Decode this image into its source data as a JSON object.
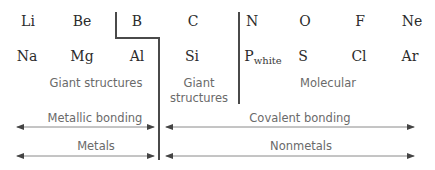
{
  "diagram": {
    "elements_row1": [
      {
        "symbol": "Li",
        "x": 28,
        "y": 21
      },
      {
        "symbol": "Be",
        "x": 82,
        "y": 21
      },
      {
        "symbol": "B",
        "x": 137,
        "y": 21
      },
      {
        "symbol": "C",
        "x": 193,
        "y": 21
      },
      {
        "symbol": "N",
        "x": 252,
        "y": 21
      },
      {
        "symbol": "O",
        "x": 305,
        "y": 21
      },
      {
        "symbol": "F",
        "x": 360,
        "y": 21
      },
      {
        "symbol": "Ne",
        "x": 412,
        "y": 21
      }
    ],
    "elements_row2": [
      {
        "symbol": "Na",
        "x": 27,
        "y": 56
      },
      {
        "symbol": "Mg",
        "x": 82,
        "y": 56
      },
      {
        "symbol": "Al",
        "x": 137,
        "y": 56
      },
      {
        "symbol": "Si",
        "x": 192,
        "y": 56
      },
      {
        "symbol": "P",
        "subscript": "white",
        "x": 263,
        "y": 57
      },
      {
        "symbol": "S",
        "x": 303,
        "y": 56
      },
      {
        "symbol": "Cl",
        "x": 359,
        "y": 56
      },
      {
        "symbol": "Ar",
        "x": 410,
        "y": 56
      }
    ],
    "structure_labels": {
      "giant_metallic": "Giant structures",
      "giant_covalent_line1": "Giant",
      "giant_covalent_line2": "structures",
      "molecular": "Molecular"
    },
    "bonding_labels": {
      "metallic": "Metallic bonding",
      "covalent": "Covalent bonding"
    },
    "classification_labels": {
      "metals": "Metals",
      "nonmetals": "Nonmetals"
    },
    "colors": {
      "line": "#4a4a4a",
      "arrow": "#7a7a7a",
      "element_text": "#2b2b2b",
      "label_text": "#6a6a6a"
    }
  }
}
